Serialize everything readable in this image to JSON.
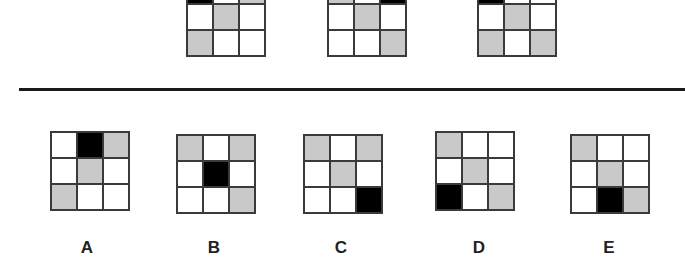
{
  "question": {
    "sequence": [
      {
        "id": "seq-1",
        "cells": [
          "b",
          "w",
          "g",
          "w",
          "g",
          "w",
          "g",
          "w",
          "w"
        ]
      },
      {
        "id": "seq-2",
        "cells": [
          "g",
          "w",
          "b",
          "w",
          "g",
          "w",
          "w",
          "w",
          "g"
        ]
      },
      {
        "id": "seq-3",
        "cells": [
          "b",
          "w",
          "w",
          "w",
          "g",
          "w",
          "g",
          "w",
          "g"
        ]
      }
    ]
  },
  "options": [
    {
      "label": "A",
      "cells": [
        "w",
        "b",
        "g",
        "w",
        "g",
        "w",
        "g",
        "w",
        "w"
      ]
    },
    {
      "label": "B",
      "cells": [
        "g",
        "w",
        "g",
        "w",
        "b",
        "w",
        "w",
        "w",
        "g"
      ]
    },
    {
      "label": "C",
      "cells": [
        "g",
        "w",
        "g",
        "w",
        "g",
        "w",
        "w",
        "w",
        "b"
      ]
    },
    {
      "label": "D",
      "cells": [
        "g",
        "w",
        "w",
        "w",
        "g",
        "w",
        "b",
        "w",
        "g"
      ]
    },
    {
      "label": "E",
      "cells": [
        "g",
        "w",
        "w",
        "w",
        "g",
        "w",
        "w",
        "b",
        "g"
      ]
    }
  ],
  "colors": {
    "grey": "#c9c9c9",
    "black": "#000000",
    "white": "#ffffff",
    "grid_line": "#3a3a3a"
  }
}
